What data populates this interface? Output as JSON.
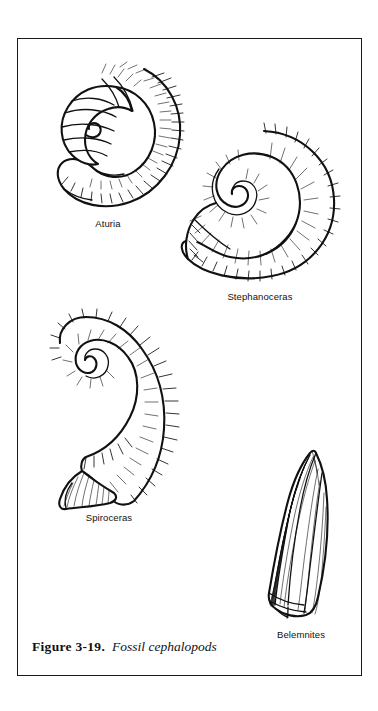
{
  "figure": {
    "caption_number": "Figure 3-19.",
    "caption_title": "Fossil cephalopods",
    "frame_color": "#1a1a1a",
    "ink_color": "#111111",
    "background_color": "#ffffff"
  },
  "specimens": [
    {
      "id": "aturia",
      "label": "Aturia",
      "form": "tightly-coiled-nautiloid",
      "description": "Involute coiled nautiloid shell with rounded inner whorl bearing curved suture lines and dense radial hatching along the outer whorl"
    },
    {
      "id": "stephanoceras",
      "label": "Stephanoceras",
      "form": "evolute-coiled-ammonite",
      "description": "Coiled ammonite with open spiral umbilicus and strong radiating ribs across the whorls"
    },
    {
      "id": "spiroceras",
      "label": "Spiroceras",
      "form": "heteromorph-open-hook",
      "description": "Uncoiled heteromorph ammonite shaped as an open hook with ribbed outer margin and a flared aperture"
    },
    {
      "id": "belemnites",
      "label": "Belemnites",
      "form": "bullet-shaped-guard",
      "description": "Elongate bullet-shaped belemnite guard with pointed apex and longitudinal striations"
    }
  ]
}
